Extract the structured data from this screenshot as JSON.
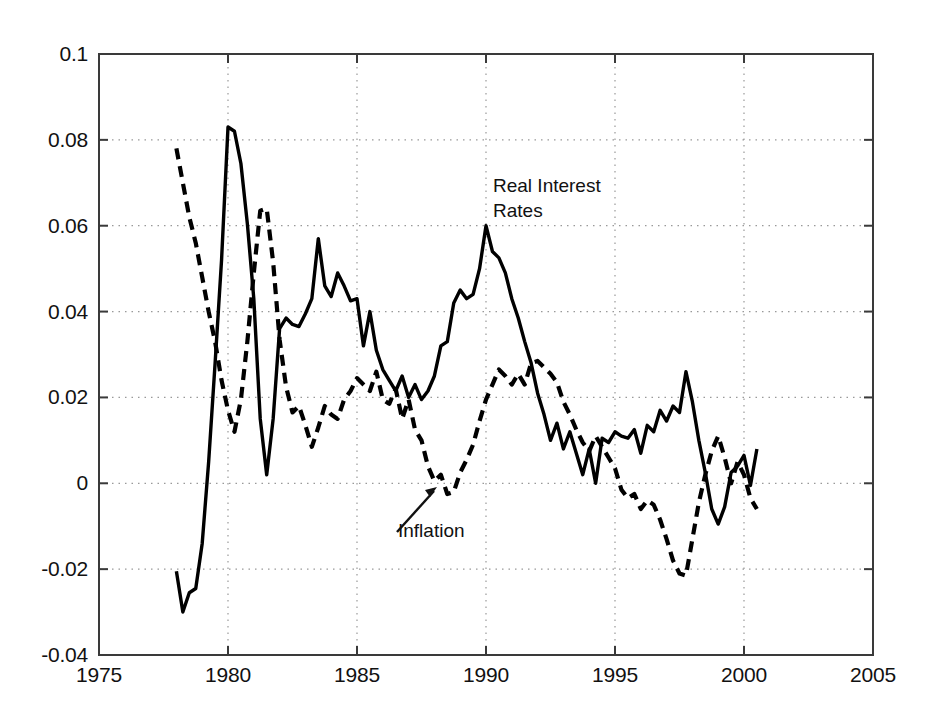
{
  "figure": {
    "background_color": "#ffffff",
    "axis_color": "#3a3a3a",
    "grid_color": "#999999",
    "line_color": "#000000"
  },
  "annotations": {
    "real_interest_rates_label": "Real Interest\nRates",
    "inflation_label": "Inflation"
  },
  "chart_data": {
    "type": "line",
    "title": "",
    "xlabel": "",
    "ylabel": "",
    "xlim": [
      1975,
      2005
    ],
    "ylim": [
      -0.04,
      0.1
    ],
    "grid": true,
    "grid_style": "dotted",
    "legend": "inline-annotations",
    "xticks": [
      1975,
      1980,
      1985,
      1990,
      1995,
      2000,
      2005
    ],
    "xtick_labels": [
      "1975",
      "1980",
      "1985",
      "1990",
      "1995",
      "2000",
      "2005"
    ],
    "yticks": [
      -0.04,
      -0.02,
      0,
      0.02,
      0.04,
      0.06,
      0.08,
      0.1
    ],
    "ytick_labels": [
      "-0.04",
      "-0.02",
      "0",
      "0.02",
      "0.04",
      "0.06",
      "0.08",
      "0.1"
    ],
    "series": [
      {
        "name": "Real Interest Rates",
        "style": "solid",
        "color": "#000000",
        "x": [
          1978.0,
          1978.25,
          1978.5,
          1978.75,
          1979.0,
          1979.25,
          1979.5,
          1979.75,
          1980.0,
          1980.25,
          1980.5,
          1980.75,
          1981.0,
          1981.25,
          1981.5,
          1981.75,
          1982.0,
          1982.25,
          1982.5,
          1982.75,
          1983.0,
          1983.25,
          1983.5,
          1983.75,
          1984.0,
          1984.25,
          1984.5,
          1984.75,
          1985.0,
          1985.25,
          1985.5,
          1985.75,
          1986.0,
          1986.25,
          1986.5,
          1986.75,
          1987.0,
          1987.25,
          1987.5,
          1987.75,
          1988.0,
          1988.25,
          1988.5,
          1988.75,
          1989.0,
          1989.25,
          1989.5,
          1989.75,
          1990.0,
          1990.25,
          1990.5,
          1990.75,
          1991.0,
          1991.25,
          1991.5,
          1991.75,
          1992.0,
          1992.25,
          1992.5,
          1992.75,
          1993.0,
          1993.25,
          1993.5,
          1993.75,
          1994.0,
          1994.25,
          1994.5,
          1994.75,
          1995.0,
          1995.25,
          1995.5,
          1995.75,
          1996.0,
          1996.25,
          1996.5,
          1996.75,
          1997.0,
          1997.25,
          1997.5,
          1997.75,
          1998.0,
          1998.25,
          1998.5,
          1998.75,
          1999.0,
          1999.25,
          1999.5,
          1999.75,
          2000.0,
          2000.25,
          2000.5
        ],
        "y": [
          -0.0205,
          -0.03,
          -0.0255,
          -0.0245,
          -0.014,
          0.005,
          0.028,
          0.052,
          0.083,
          0.082,
          0.0745,
          0.0605,
          0.043,
          0.015,
          0.002,
          0.015,
          0.036,
          0.0385,
          0.037,
          0.0365,
          0.0395,
          0.043,
          0.057,
          0.046,
          0.0435,
          0.049,
          0.046,
          0.0425,
          0.043,
          0.032,
          0.04,
          0.031,
          0.0265,
          0.024,
          0.0215,
          0.025,
          0.02,
          0.023,
          0.0195,
          0.0215,
          0.025,
          0.032,
          0.033,
          0.042,
          0.045,
          0.043,
          0.044,
          0.05,
          0.06,
          0.054,
          0.0525,
          0.049,
          0.043,
          0.0385,
          0.033,
          0.028,
          0.021,
          0.016,
          0.01,
          0.014,
          0.008,
          0.012,
          0.007,
          0.002,
          0.008,
          0.0,
          0.0105,
          0.0095,
          0.012,
          0.011,
          0.0105,
          0.0125,
          0.007,
          0.0135,
          0.012,
          0.017,
          0.0145,
          0.018,
          0.0165,
          0.026,
          0.019,
          0.01,
          0.0025,
          -0.006,
          -0.0095,
          -0.0055,
          0.0025,
          0.004,
          0.0065,
          -0.0005,
          0.008
        ]
      },
      {
        "name": "Inflation",
        "style": "dashed",
        "color": "#000000",
        "x": [
          1978.0,
          1978.25,
          1978.5,
          1978.75,
          1979.0,
          1979.25,
          1979.5,
          1979.75,
          1980.0,
          1980.25,
          1980.5,
          1980.75,
          1981.0,
          1981.25,
          1981.5,
          1981.75,
          1982.0,
          1982.25,
          1982.5,
          1982.75,
          1983.0,
          1983.25,
          1983.5,
          1983.75,
          1984.0,
          1984.25,
          1984.5,
          1984.75,
          1985.0,
          1985.25,
          1985.5,
          1985.75,
          1986.0,
          1986.25,
          1986.5,
          1986.75,
          1987.0,
          1987.25,
          1987.5,
          1987.75,
          1988.0,
          1988.25,
          1988.5,
          1988.75,
          1989.0,
          1989.25,
          1989.5,
          1989.75,
          1990.0,
          1990.25,
          1990.5,
          1990.75,
          1991.0,
          1991.25,
          1991.5,
          1991.75,
          1992.0,
          1992.25,
          1992.5,
          1992.75,
          1993.0,
          1993.25,
          1993.5,
          1993.75,
          1994.0,
          1994.25,
          1994.5,
          1994.75,
          1995.0,
          1995.25,
          1995.5,
          1995.75,
          1996.0,
          1996.25,
          1996.5,
          1996.75,
          1997.0,
          1997.25,
          1997.5,
          1997.75,
          1998.0,
          1998.25,
          1998.5,
          1998.75,
          1999.0,
          1999.25,
          1999.5,
          1999.75,
          2000.0,
          2000.25,
          2000.5
        ],
        "y": [
          0.078,
          0.07,
          0.062,
          0.056,
          0.048,
          0.04,
          0.033,
          0.024,
          0.017,
          0.012,
          0.0195,
          0.033,
          0.049,
          0.0635,
          0.064,
          0.0515,
          0.0335,
          0.0225,
          0.0165,
          0.018,
          0.0135,
          0.0085,
          0.013,
          0.018,
          0.016,
          0.015,
          0.0195,
          0.0215,
          0.0245,
          0.023,
          0.0215,
          0.026,
          0.0195,
          0.0185,
          0.022,
          0.015,
          0.0195,
          0.0125,
          0.01,
          0.004,
          0.0005,
          0.002,
          -0.0025,
          -0.002,
          0.0025,
          0.0055,
          0.009,
          0.0145,
          0.0195,
          0.023,
          0.0265,
          0.025,
          0.023,
          0.0255,
          0.023,
          0.028,
          0.0285,
          0.027,
          0.0255,
          0.0235,
          0.019,
          0.016,
          0.0125,
          0.0095,
          0.0075,
          0.011,
          0.0085,
          0.006,
          0.0035,
          -0.0015,
          -0.0035,
          -0.0025,
          -0.006,
          -0.004,
          -0.005,
          -0.0085,
          -0.013,
          -0.018,
          -0.021,
          -0.0215,
          -0.013,
          -0.0045,
          0.002,
          0.0075,
          0.011,
          0.006,
          0.0,
          0.005,
          0.002,
          -0.0035,
          -0.006
        ]
      }
    ]
  }
}
